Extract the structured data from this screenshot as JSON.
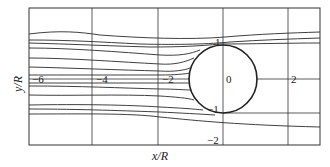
{
  "figure": {
    "type": "streamline-diagram",
    "axes": {
      "xlabel": "x/R",
      "ylabel": "y/R",
      "x_ticks": [
        "-6",
        "-4",
        "-2",
        "0",
        "2"
      ],
      "y_ticks": [
        "1",
        "-1",
        "-2"
      ]
    },
    "cylinder": {
      "center": [
        0,
        0
      ],
      "radius": 1
    }
  },
  "labels": {
    "x_tick_m6": "−6",
    "x_tick_m4": "−4",
    "x_tick_m2": "−2",
    "x_tick_0": "0",
    "x_tick_2": "2",
    "y_tick_1": "1",
    "y_tick_m1": "−1",
    "y_tick_m2": "−2",
    "xlabel": "x/R",
    "ylabel": "y/R"
  },
  "colors": {
    "line": "#2a2a2a",
    "background": "#ffffff"
  }
}
